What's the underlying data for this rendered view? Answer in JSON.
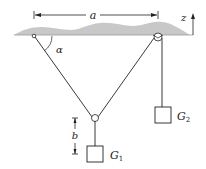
{
  "figure": {
    "labels": {
      "a": "a",
      "z": "z",
      "alpha": "α",
      "b": "b",
      "G1_main": "G",
      "G1_sub": "1",
      "G2_main": "G",
      "G2_sub": "2"
    },
    "colors": {
      "line": "#222222",
      "ceiling": "#c8c8c8"
    }
  }
}
